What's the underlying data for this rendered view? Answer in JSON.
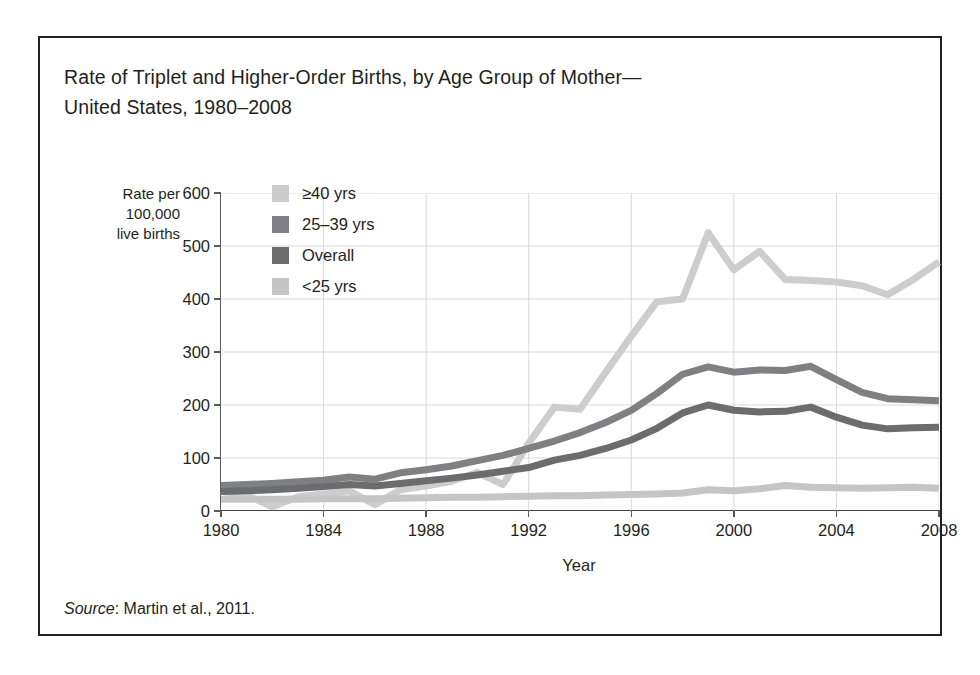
{
  "figure": {
    "title": "Rate of  Triplet and Higher-Order Births, by Age Group of Mother—\nUnited States, 1980–2008",
    "source_word": "Source",
    "source_rest": ": Martin et al., 2011."
  },
  "colors": {
    "ge40": "#cdcdcd",
    "age25_39": "#7f8083",
    "overall": "#6b6c6e",
    "lt25": "#c4c5c7",
    "axis": "#414042",
    "grid": "#d9d9d9",
    "text": "#231f20",
    "frame": "#231f20"
  },
  "chart_data": {
    "type": "line",
    "xlabel": "Year",
    "ylabel": "Rate per\n100,000\nlive births",
    "ylabel_lines": [
      "Rate per",
      "100,000",
      "live births"
    ],
    "xlim": [
      1980,
      2008
    ],
    "ylim": [
      0,
      600
    ],
    "ytick_labels": [
      "0",
      "100",
      "200",
      "300",
      "400",
      "500",
      "600"
    ],
    "yticks": [
      0,
      100,
      200,
      300,
      400,
      500,
      600
    ],
    "xtick_labels": [
      "1980",
      "1984",
      "1988",
      "1992",
      "1996",
      "2000",
      "2004",
      "2008"
    ],
    "xticks": [
      1980,
      1984,
      1988,
      1992,
      1996,
      2000,
      2004,
      2008
    ],
    "grid": true,
    "legend_position": "upper-left-inside",
    "x": [
      1980,
      1981,
      1982,
      1983,
      1984,
      1985,
      1986,
      1987,
      1988,
      1989,
      1990,
      1991,
      1992,
      1993,
      1994,
      1995,
      1996,
      1997,
      1998,
      1999,
      2000,
      2001,
      2002,
      2003,
      2004,
      2005,
      2006,
      2007,
      2008
    ],
    "series": [
      {
        "name": "≥40 yrs",
        "color": "#cdcdcd",
        "values": [
          37,
          30,
          8,
          27,
          32,
          38,
          12,
          40,
          47,
          56,
          73,
          50,
          128,
          196,
          192,
          262,
          330,
          395,
          400,
          525,
          455,
          490,
          437,
          435,
          432,
          425,
          408,
          437,
          470
        ]
      },
      {
        "name": "25–39 yrs",
        "color": "#7f8083",
        "values": [
          48,
          50,
          52,
          55,
          58,
          64,
          60,
          72,
          78,
          85,
          95,
          105,
          118,
          132,
          148,
          167,
          190,
          222,
          258,
          272,
          262,
          266,
          265,
          273,
          248,
          224,
          212,
          210,
          208
        ]
      },
      {
        "name": "Overall",
        "color": "#6b6c6e",
        "values": [
          37,
          38,
          40,
          43,
          46,
          50,
          47,
          52,
          57,
          62,
          68,
          75,
          82,
          96,
          105,
          118,
          134,
          156,
          185,
          200,
          190,
          187,
          188,
          196,
          177,
          162,
          155,
          157,
          158
        ]
      },
      {
        "name": "<25 yrs",
        "color": "#c4c5c7",
        "values": [
          22,
          22,
          22,
          22,
          23,
          23,
          23,
          24,
          25,
          26,
          26,
          27,
          28,
          29,
          29,
          30,
          31,
          32,
          34,
          40,
          38,
          42,
          48,
          45,
          44,
          43,
          44,
          45,
          43
        ]
      }
    ]
  },
  "legend": {
    "items": [
      {
        "label": "≥40 yrs",
        "color": "#cdcdcd"
      },
      {
        "label": "25–39 yrs",
        "color": "#7f8083"
      },
      {
        "label": "Overall",
        "color": "#6b6c6e"
      },
      {
        "label": "<25 yrs",
        "color": "#c4c5c7"
      }
    ]
  }
}
